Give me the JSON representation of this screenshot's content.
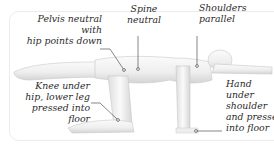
{
  "diagram": {
    "annotations": [
      {
        "id": "pelvis",
        "text": "Pelvis neutral with\nhip points down"
      },
      {
        "id": "spine",
        "text": "Spine\nneutral"
      },
      {
        "id": "shoulders",
        "text": "Shoulders\nparallel"
      },
      {
        "id": "knee",
        "text": "Knee under\nhip, lower leg\npressed into floor"
      },
      {
        "id": "hand",
        "text": "Hand\nunder\nshoulder\nand pressed\ninto floor"
      }
    ],
    "colors": {
      "figure_fill": "#f3f3f3",
      "figure_shade": "#d9d9d9",
      "leader_line": "#555555",
      "text": "#2a2a2a",
      "frame": "#ececec"
    }
  }
}
